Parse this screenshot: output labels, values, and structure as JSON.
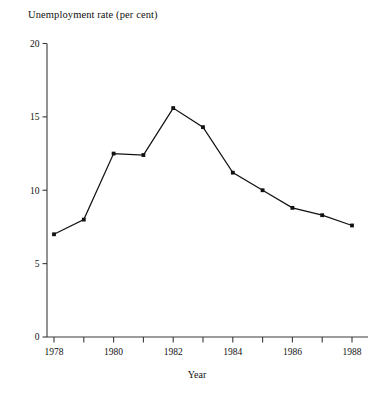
{
  "chart_data": {
    "type": "line",
    "title": "Unemployment rate (per cent)",
    "xlabel": "Year",
    "ylabel": "",
    "x": [
      1978,
      1979,
      1980,
      1981,
      1982,
      1983,
      1984,
      1985,
      1986,
      1987,
      1988
    ],
    "values": [
      7.0,
      8.0,
      12.5,
      12.4,
      15.6,
      14.3,
      11.2,
      10.0,
      8.8,
      8.3,
      7.6
    ],
    "series": [
      {
        "name": "Unemployment rate",
        "values": [
          7.0,
          8.0,
          12.5,
          12.4,
          15.6,
          14.3,
          11.2,
          10.0,
          8.8,
          8.3,
          7.6
        ]
      }
    ],
    "xlim": [
      1977.5,
      1988.5
    ],
    "ylim": [
      0,
      20
    ],
    "yticks": [
      0,
      5,
      10,
      15,
      20
    ],
    "ytick_labels": [
      "0",
      "5",
      "10",
      "15",
      "20"
    ],
    "xticks": [
      1978,
      1979,
      1980,
      1981,
      1982,
      1983,
      1984,
      1985,
      1986,
      1987,
      1988
    ],
    "xtick_labels": [
      "1978",
      "",
      "1980",
      "",
      "1982",
      "",
      "1984",
      "",
      "1986",
      "",
      "1988"
    ],
    "grid": false,
    "legend": false,
    "marker": "filled-square",
    "line_color": "#111111",
    "axis_color": "#3a3a3a",
    "background_color": "#ffffff"
  }
}
